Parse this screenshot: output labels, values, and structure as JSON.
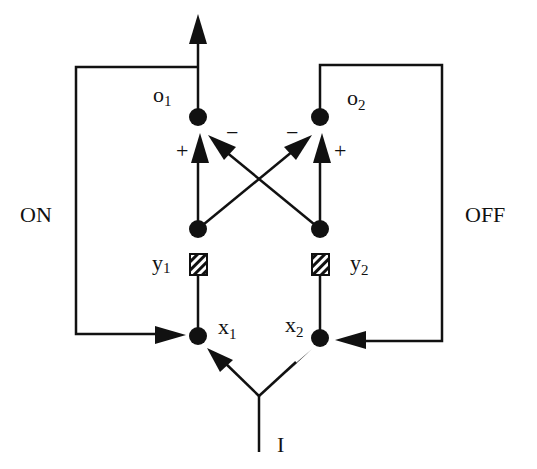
{
  "diagram": {
    "type": "gated-dipole-circuit",
    "labels": {
      "on": "ON",
      "off": "OFF",
      "input": "I"
    },
    "nodes": {
      "o1": {
        "base": "o",
        "sub": "1"
      },
      "o2": {
        "base": "o",
        "sub": "2"
      },
      "y1": {
        "base": "y",
        "sub": "1"
      },
      "y2": {
        "base": "y",
        "sub": "2"
      },
      "x1": {
        "base": "x",
        "sub": "1"
      },
      "x2": {
        "base": "x",
        "sub": "2"
      }
    },
    "signs": {
      "o1_excitatory": "+",
      "o1_inhibitory": "−",
      "o2_excitatory": "+",
      "o2_inhibitory": "−"
    },
    "colors": {
      "stroke": "#111111",
      "background": "#ffffff"
    }
  }
}
